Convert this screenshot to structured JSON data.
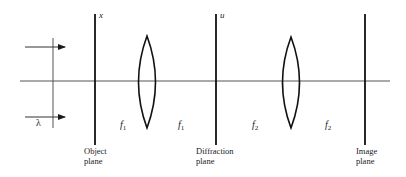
{
  "diagram": {
    "optical_axis": {
      "x1": 20,
      "x2": 390,
      "y": 81
    },
    "incident_wavefront": {
      "x": 53,
      "y1": 38,
      "y2": 128
    },
    "arrows": [
      {
        "x1": 25,
        "x2": 65,
        "y": 47
      },
      {
        "x1": 25,
        "x2": 65,
        "y": 117
      }
    ],
    "wavelength_label": "λ",
    "planes": [
      {
        "id": "object",
        "x": 95,
        "y1": 14,
        "y2": 145,
        "axis_letter": "x",
        "label_line1": "Object",
        "label_line2": "plane"
      },
      {
        "id": "diffraction",
        "x": 216,
        "y1": 14,
        "y2": 145,
        "axis_letter": "u",
        "label_line1": "Diffraction",
        "label_line2": "plane"
      },
      {
        "id": "image",
        "x": 365,
        "y1": 14,
        "y2": 145,
        "axis_letter": "",
        "label_line1": "Image",
        "label_line2": "plane"
      }
    ],
    "lenses": [
      {
        "id": "lens-1",
        "cx": 147,
        "top": 36,
        "bottom": 128,
        "half_width": 8.5
      },
      {
        "id": "lens-2",
        "cx": 291,
        "top": 37,
        "bottom": 128,
        "half_width": 8.5
      }
    ],
    "focal_labels": [
      {
        "text": "f",
        "sub": "1",
        "x": 120,
        "y": 119
      },
      {
        "text": "f",
        "sub": "1",
        "x": 178,
        "y": 119
      },
      {
        "text": "f",
        "sub": "2",
        "x": 252,
        "y": 119
      },
      {
        "text": "f",
        "sub": "2",
        "x": 325,
        "y": 119
      }
    ]
  }
}
